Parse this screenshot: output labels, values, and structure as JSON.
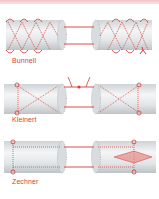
{
  "figure": {
    "colors": {
      "suture": "#d63a34",
      "tendon_fill": "#e6e8ea",
      "tendon_edge": "#b8bcc0",
      "top_band": "#f2c4c8",
      "label": "#d0453f"
    },
    "panels": [
      {
        "label": "Bunnell"
      },
      {
        "label": "Kleinert"
      },
      {
        "label": "Zechner"
      }
    ]
  }
}
